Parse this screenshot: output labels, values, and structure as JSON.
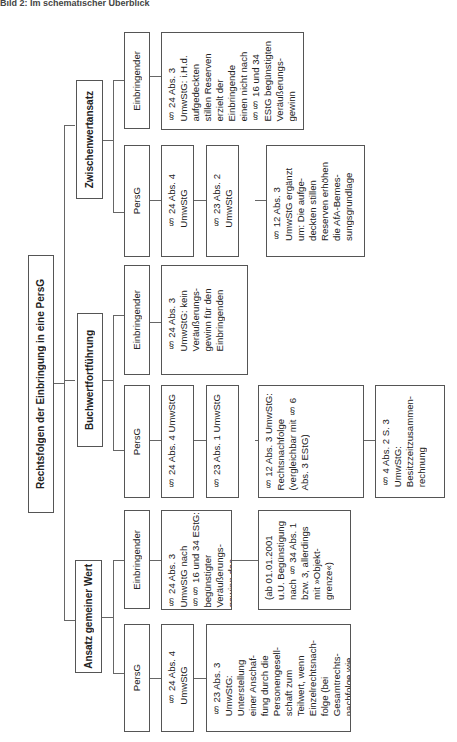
{
  "caption": "Bild 2: Im schematischer Überblick",
  "root": {
    "label": "Rechtsfolgen der Einbringung in eine PersG"
  },
  "groups": [
    {
      "label": "Zwischenwertansatz",
      "columns": [
        {
          "header": "Einbringender",
          "items": [
            "§ 24 Abs. 3\nUmwStG: i.H.d.\naufgedeckten\nstillen Reserven\nerzielt der\nEinbringende\neinen nicht nach\n§§ 16 und 34\nEStG begünstigten\nVeräußerungs-\ngewinn"
          ]
        },
        {
          "header": "PersG",
          "items": [
            "§ 24 Abs. 4\nUmwStG",
            "§ 23 Abs. 2\nUmwStG",
            "§ 12 Abs. 3\nUmwStG ergänzt\num: Die aufge-\ndeckten stillen\nReserven erhöhen\ndie AfA-Bemes-\nsungsgrundlage"
          ]
        }
      ]
    },
    {
      "label": "Buchwertfortführung",
      "columns": [
        {
          "header": "Einbringender",
          "items": [
            "§ 24 Abs. 3\nUmwStG: kein\nVeräußerungs-\ngewinn für den\nEinbringenden"
          ]
        },
        {
          "header": "PersG",
          "items": [
            "§ 24 Abs. 4 UmwStG",
            "§ 23 Abs. 1 UmwStG",
            "§ 12 Abs. 3 UmwStG:\nRechtsnachfolge\n(vergleichbar mit § 6\nAbs. 3 EStG)",
            "§ 4 Abs. 2 S. 3\nUmwStG:\nBesitzzeitzusammen-\nrechnung"
          ]
        }
      ]
    },
    {
      "label": "Ansatz gemeiner Wert",
      "columns": [
        {
          "header": "Einbringender",
          "items": [
            "§ 24 Abs. 3\nUmwStG nach\n§§ 16 und 34 EStG:\nbegünstigter\nVeräußerungs-\ngewinn des\nEinbringenden",
            "(ab 01.01.2001\nu.U. Begünstigung\nnach § 34 Abs. 1\nbzw. 3, allerdings\nmit »Objekt-\ngrenze«)"
          ]
        },
        {
          "header": "PersG",
          "items": [
            "§ 24 Abs. 4\nUmwStG",
            "§ 23 Abs. 3\nUmwStG:\nUnterstellung\neiner Anschaf-\nfung durch die\nPersonengesell-\nschaft zum\nTeilwert, wenn\nEinzelrechtsnach-\nfolge (bei\nGesamtrechts-\nnachfolge wie\nZwischenwert)"
          ]
        }
      ]
    }
  ]
}
